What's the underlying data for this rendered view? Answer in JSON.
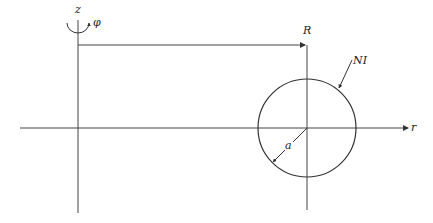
{
  "diagram": {
    "labels": {
      "z_axis": "z",
      "phi": "φ",
      "r_axis": "r",
      "major_radius": "R",
      "current": "NI",
      "minor_radius": "a"
    },
    "colors": {
      "line": "#333333",
      "background": "#ffffff"
    }
  }
}
